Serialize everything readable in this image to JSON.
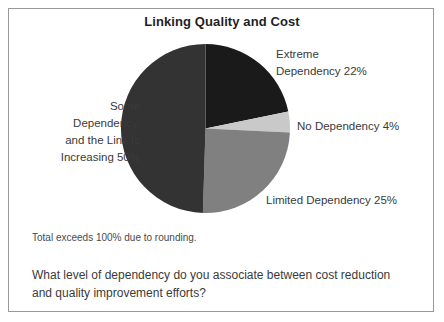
{
  "chart_title": "Linking Quality and Cost",
  "footnote": "Total exceeds 100% due to rounding.",
  "question": {
    "line1": "What level of dependency do you associate between cost reduction",
    "line2": "and quality improvement efforts?"
  },
  "labels": {
    "extreme_line1": "Extreme",
    "extreme_line2": "Dependency 22%",
    "no_dependency": "No Dependency 4%",
    "limited": "Limited Dependency 25%",
    "some_line1": "Some",
    "some_line2": "Dependency,",
    "some_line3": "and the Link Is",
    "some_line4": "Increasing 50%"
  },
  "chart_data": {
    "type": "pie",
    "title": "Linking Quality and Cost",
    "xlabel": "",
    "ylabel": "",
    "note": "Total exceeds 100% due to rounding.",
    "question": "What level of dependency do you associate between cost reduction and quality improvement efforts?",
    "legend_position": "callout-labels",
    "grid": false,
    "start_angle_deg": 0,
    "direction": "clockwise",
    "categories": [
      "Extreme Dependency",
      "No Dependency",
      "Limited Dependency",
      "Some Dependency, and the Link Is Increasing"
    ],
    "values": [
      22,
      4,
      25,
      50
    ],
    "value_unit": "percent",
    "total": 101,
    "slices": [
      {
        "name": "Extreme Dependency",
        "value": 22,
        "label": "Extreme Dependency 22%",
        "color": "#1a1a1a",
        "start_deg": 0,
        "end_deg": 79.2
      },
      {
        "name": "No Dependency",
        "value": 4,
        "label": "No Dependency 4%",
        "color": "#c9c9c9",
        "start_deg": 79.2,
        "end_deg": 93.6
      },
      {
        "name": "Limited Dependency",
        "value": 25,
        "label": "Limited Dependency 25%",
        "color": "#808080",
        "start_deg": 93.6,
        "end_deg": 183.6
      },
      {
        "name": "Some Dependency, and the Link Is Increasing",
        "value": 50,
        "label": "Some Dependency, and the Link Is Increasing 50%",
        "color": "#333333",
        "start_deg": 183.6,
        "end_deg": 360
      }
    ]
  }
}
